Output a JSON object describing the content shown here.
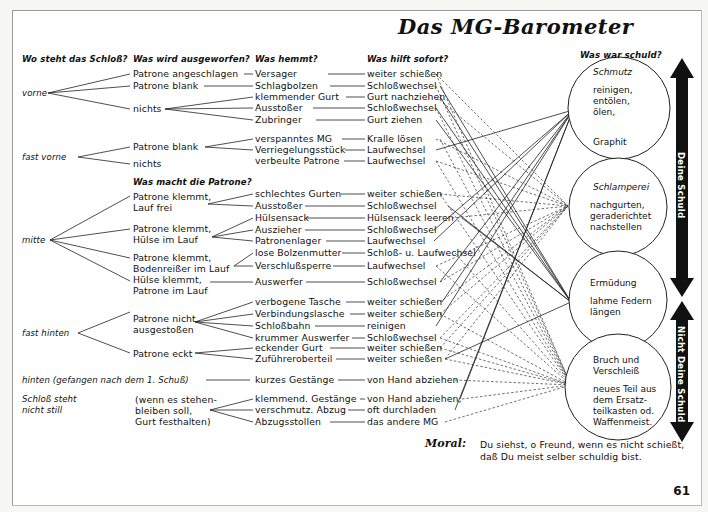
{
  "title": "Das MG-Barometer",
  "headers": {
    "col1": "Wo steht das Schloß?",
    "col2": "Was wird ausgeworfen?",
    "col3": "Was hemmt?",
    "col4": "Was hilft sofort?",
    "col5": "Was war schuld?",
    "col2b": "Was macht die Patrone?"
  },
  "positions": {
    "vorne": "vorne",
    "fast_vorne": "fast vorne",
    "mitte": "mitte",
    "fast_hinten": "fast hinten",
    "hinten": "hinten (gefangen nach dem 1. Schuß)",
    "steht_nicht_1": "Schloß steht",
    "steht_nicht_2": "nicht still"
  },
  "ejected": {
    "v1": "Patrone angeschlagen",
    "v2": "Patrone blank",
    "v3": "nichts",
    "fv1": "Patrone blank",
    "fv2": "nichts",
    "m1a": "Patrone klemmt,",
    "m1b": "Lauf frei",
    "m2a": "Patrone klemmt,",
    "m2b": "Hülse im Lauf",
    "m3a": "Patrone klemmt,",
    "m3b": "Bodenreißer im Lauf",
    "m4a": "Hülse klemmt,",
    "m4b": "Patrone im Lauf",
    "fh1a": "Patrone nicht",
    "fh1b": "ausgestoßen",
    "fh2": "Patrone eckt",
    "sn1": "(wenn es stehen-",
    "sn2": "bleiben soll,",
    "sn3": "Gurt festhalten)"
  },
  "rows": [
    {
      "cause": "Versager",
      "fix": "weiter schießen"
    },
    {
      "cause": "Schlagbolzen",
      "fix": "Schloßwechsel"
    },
    {
      "cause": "klemmender Gurt",
      "fix": "Gurt nachziehen"
    },
    {
      "cause": "Ausstoßer",
      "fix": "Schloßwechsel"
    },
    {
      "cause": "Zubringer",
      "fix": "Gurt ziehen"
    },
    {
      "cause": "verspanntes MG",
      "fix": "Kralle lösen"
    },
    {
      "cause": "Verriegelungsstück",
      "fix": "Laufwechsel"
    },
    {
      "cause": "verbeulte Patrone",
      "fix": "Laufwechsel"
    },
    {
      "cause": "schlechtes Gurten",
      "fix": "weiter schießen"
    },
    {
      "cause": "Ausstoßer",
      "fix": "Schloßwechsel"
    },
    {
      "cause": "Hülsensack",
      "fix": "Hülsensack leeren"
    },
    {
      "cause": "Auszieher",
      "fix": "Schloßwechsel"
    },
    {
      "cause": "Patronenlager",
      "fix": "Laufwechsel"
    },
    {
      "cause": "lose Bolzenmutter",
      "fix": "Schloß- u. Laufwechsel"
    },
    {
      "cause": "Verschlußsperre",
      "fix": "Laufwechsel"
    },
    {
      "cause": "Auswerfer",
      "fix": "Schloßwechsel"
    },
    {
      "cause": "verbogene Tasche",
      "fix": "weiter schießen"
    },
    {
      "cause": "Verbindungslasche",
      "fix": "weiter schießen"
    },
    {
      "cause": "Schloßbahn",
      "fix": "reinigen"
    },
    {
      "cause": "krummer Auswerfer",
      "fix": "Schloßwechsel"
    },
    {
      "cause": "eckender Gurt",
      "fix": "weiter schießen"
    },
    {
      "cause": "Zuführeroberteil",
      "fix": "weiter schießen"
    },
    {
      "cause": "kurzes Gestänge",
      "fix": "von Hand abziehen"
    },
    {
      "cause": "klemmend. Gestänge",
      "fix": "von Hand abziehen,"
    },
    {
      "cause": "verschmutz. Abzug",
      "fix": "oft durchladen"
    },
    {
      "cause": "Abzugsstollen",
      "fix": "das andere MG"
    }
  ],
  "circles": [
    {
      "heading": "Schmutz",
      "lines": [
        "reinigen,",
        "entölen,",
        "ölen,",
        "",
        "Graphit"
      ]
    },
    {
      "heading": "Schlamperei",
      "lines": [
        "nachgurten,",
        "geraderichtet",
        "nachstellen"
      ]
    },
    {
      "heading": "Ermüdung",
      "lines": [
        "lahme Federn",
        "längen"
      ]
    },
    {
      "heading": "Bruch und",
      "heading2": "Verschleiß",
      "lines": [
        "neues Teil aus",
        "dem Ersatz-",
        "teilkasten od.",
        "Waffenmeist."
      ]
    }
  ],
  "arrows": {
    "upper": "Deine Schuld",
    "lower": "Nicht Deine Schuld"
  },
  "moral": {
    "label": "Moral:",
    "line1": "Du siehst, o Freund, wenn es nicht schießt,",
    "line2": "daß Du meist selber schuldig bist."
  },
  "page_number": "61",
  "colors": {
    "ink": "#111111",
    "paper": "#ffffff",
    "arrow": "#111111"
  }
}
